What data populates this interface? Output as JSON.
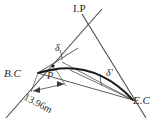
{
  "diagram": {
    "background_color": "#ffffff",
    "line_color": "#3a3a3a",
    "curve_color": "#1a1a1a",
    "labels": {
      "ip": "I.P",
      "bc": "B.C",
      "ec": "E.C",
      "point_p": "P",
      "delta": "δ",
      "delta_prime": "δ′",
      "dimension": "13.96m"
    },
    "points": {
      "ip": {
        "x": 88,
        "y": 22
      },
      "bc": {
        "x": 38,
        "y": 73
      },
      "ec": {
        "x": 132,
        "y": 100
      },
      "p": {
        "x": 53,
        "y": 67
      }
    },
    "measurements": {
      "chord_bc_to_p": "13.96m"
    }
  }
}
